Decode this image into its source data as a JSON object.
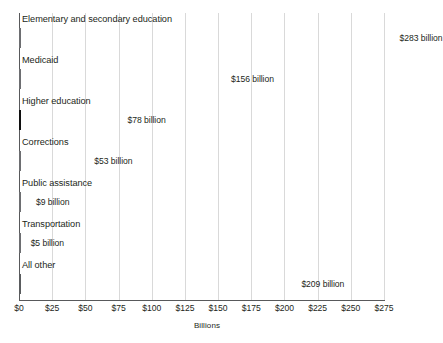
{
  "chart_data": {
    "type": "bar",
    "orientation": "horizontal",
    "title": "",
    "xlabel": "Billions",
    "ylabel": "",
    "xlim": [
      0,
      275
    ],
    "grid": true,
    "legend": "none",
    "units": "billion",
    "categories": [
      "Elementary and secondary education",
      "Medicaid",
      "Higher education",
      "Corrections",
      "Public assistance",
      "Transportation",
      "All other"
    ],
    "values": [
      283,
      156,
      78,
      53,
      9,
      5,
      209
    ],
    "value_labels": [
      "$283 billion",
      "$156 billion",
      "$78 billion",
      "$53 billion",
      "$9 billion",
      "$5 billion",
      "$209 billion"
    ],
    "bar_colors": [
      "#d2d3d4",
      "#d2d3d4",
      "#101010",
      "#d2d3d4",
      "#d2d3d4",
      "#d2d3d4",
      "#808285"
    ],
    "bar_styles": [
      "light",
      "light",
      "dark",
      "light",
      "light",
      "light",
      "mid"
    ],
    "xticks": [
      0,
      25,
      50,
      75,
      100,
      125,
      150,
      175,
      200,
      225,
      250,
      275
    ],
    "xtick_labels": [
      "$0",
      "$25",
      "$50",
      "$75",
      "$100",
      "$125",
      "$150",
      "$175",
      "$200",
      "$225",
      "$250",
      "$275"
    ],
    "colors": {
      "light_bar": "#d2d3d4",
      "dark_bar": "#101010",
      "mid_bar": "#808285",
      "bar_outline": "#6d6e71",
      "gridline": "#d9d9d9",
      "axis": "#58595b",
      "text": "#231f20",
      "background": "#ffffff"
    }
  }
}
